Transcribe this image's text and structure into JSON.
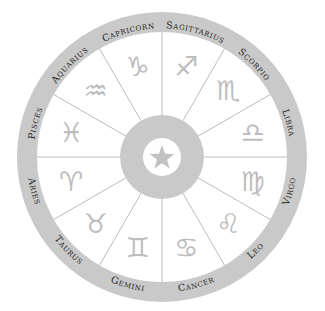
{
  "wheel": {
    "center": [
      162,
      157
    ],
    "outer_radius": 145,
    "ring_inner_radius": 125,
    "hub_radius": 42,
    "hole_radius": 19,
    "label_radius": 132,
    "glyph_radius": 94,
    "colors": {
      "ring": "#c9c9c9",
      "hub": "#c9c9c9",
      "divider": "#a9a9a9",
      "glyph": "#bdbdbd",
      "label": "#1e1e1e",
      "star": "#c2c2c2",
      "background": "#ffffff"
    },
    "center_icon": "star-icon"
  },
  "signs": [
    {
      "name": "Libra",
      "label": "Libra",
      "symbol": "♎",
      "angle": -15
    },
    {
      "name": "Scorpio",
      "label": "Scorpio",
      "symbol": "♏",
      "angle": -45
    },
    {
      "name": "Sagittarius",
      "label": "Sagittarius",
      "symbol": "♐",
      "angle": -75
    },
    {
      "name": "Capricorn",
      "label": "Capricorn",
      "symbol": "♑",
      "angle": -105
    },
    {
      "name": "Aquarius",
      "label": "Aquarius",
      "symbol": "♒",
      "angle": -135
    },
    {
      "name": "Pisces",
      "label": "Pisces",
      "symbol": "♓",
      "angle": -165
    },
    {
      "name": "Aries",
      "label": "Aries",
      "symbol": "♈",
      "angle": 165
    },
    {
      "name": "Taurus",
      "label": "Taurus",
      "symbol": "♉",
      "angle": 135
    },
    {
      "name": "Gemini",
      "label": "Gemini",
      "symbol": "♊",
      "angle": 105
    },
    {
      "name": "Cancer",
      "label": "Cancer",
      "symbol": "♋",
      "angle": 75
    },
    {
      "name": "Leo",
      "label": "Leo",
      "symbol": "♌",
      "angle": 45
    },
    {
      "name": "Virgo",
      "label": "Virgo",
      "symbol": "♍",
      "angle": 15
    }
  ]
}
